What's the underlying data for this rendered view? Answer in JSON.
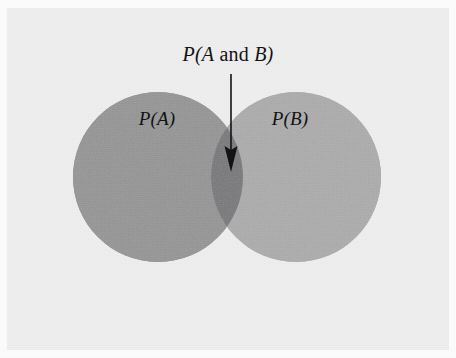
{
  "figure": {
    "type": "venn-diagram",
    "background_color": "#efeff0",
    "page_color": "#fdfdfd"
  },
  "labels": {
    "intersection": {
      "prefix": "P(",
      "operand_a": "A",
      "operator": " and ",
      "operand_b": "B",
      "suffix": ")",
      "full_text": "P(A and B)"
    },
    "circle_a": {
      "prefix": "P(",
      "operand": "A",
      "suffix": ")",
      "full_text": "P(A)"
    },
    "circle_b": {
      "prefix": "P(",
      "operand": "B",
      "suffix": ")",
      "full_text": "P(B)"
    }
  },
  "shapes": {
    "circle_a": {
      "name": "P(A)",
      "cx": 158,
      "cy": 177,
      "r": 85,
      "fill": "#959596"
    },
    "circle_b": {
      "name": "P(B)",
      "cx": 296,
      "cy": 177,
      "r": 85,
      "fill": "#adadae"
    },
    "intersection": {
      "name": "P(A and B)",
      "fill": "#77777a"
    }
  },
  "annotation": {
    "arrow": {
      "name": "pointer-arrow",
      "from_x": 231,
      "from_y": 74,
      "to_x": 231,
      "to_y": 172,
      "color": "#111111",
      "shaft_width": 1.6,
      "head_width": 13,
      "head_length": 26
    }
  }
}
